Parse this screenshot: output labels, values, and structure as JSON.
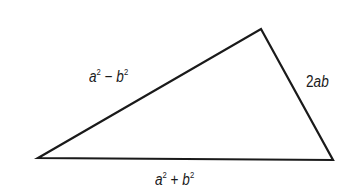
{
  "diagram": {
    "type": "triangle",
    "sides": {
      "left": {
        "var1": "a",
        "exp1": "2",
        "op": "−",
        "var2": "b",
        "exp2": "2"
      },
      "right": {
        "coef": "2",
        "vars": "ab"
      },
      "bottom": {
        "var1": "a",
        "exp1": "2",
        "op": "+",
        "var2": "b",
        "exp2": "2"
      }
    },
    "colors": {
      "stroke": "#1a1a1a",
      "background": "#ffffff"
    }
  }
}
